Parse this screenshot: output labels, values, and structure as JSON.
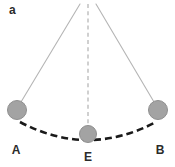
{
  "figure": {
    "panel_letter": "a",
    "type": "pendulum-swing-diagram",
    "background_color": "#ffffff",
    "width": 175,
    "height": 167
  },
  "colors": {
    "bob_fill": "#a3a3a3",
    "bob_stroke": "#8f8f8f",
    "string": "#b5b5b5",
    "center_dashed_line": "#bdbdbd",
    "arc": "#1a1a1a",
    "label_text": "#2b2b2b"
  },
  "pivot": {
    "x": 88,
    "y": 4
  },
  "bobs": [
    {
      "name": "bob-a",
      "label": "A",
      "cx": 17,
      "cy": 110,
      "r": 9.5,
      "description": "left extreme displacement"
    },
    {
      "name": "bob-e",
      "label": "E",
      "cx": 88,
      "cy": 134,
      "r": 8.5,
      "description": "equilibrium / lowest point"
    },
    {
      "name": "bob-b",
      "label": "B",
      "cx": 158,
      "cy": 110,
      "r": 9.5,
      "description": "right extreme displacement"
    }
  ],
  "strings": [
    {
      "name": "string-to-a",
      "x1": 80,
      "y1": 4,
      "x2": 21,
      "y2": 102,
      "style": "solid"
    },
    {
      "name": "string-to-e",
      "x1": 88,
      "y1": 4,
      "x2": 88,
      "y2": 126,
      "style": "dashed"
    },
    {
      "name": "string-to-b",
      "x1": 96,
      "y1": 4,
      "x2": 154,
      "y2": 102,
      "style": "solid"
    }
  ],
  "arc": {
    "name": "swing-path-arc",
    "style": "dashed",
    "from_label": "A",
    "via_label": "E",
    "to_label": "B",
    "start": {
      "x": 20,
      "y": 122
    },
    "control": {
      "x": 88,
      "y": 158
    },
    "end": {
      "x": 156,
      "y": 122
    },
    "dash_pattern": "7 4",
    "stroke_width": 2.6
  },
  "labels": {
    "a": "A",
    "e": "E",
    "b": "B"
  }
}
